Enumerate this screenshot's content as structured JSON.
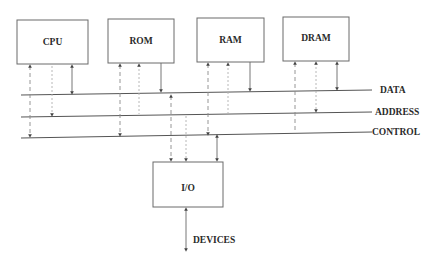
{
  "diagram": {
    "components": [
      {
        "id": "cpu",
        "label": "CPU",
        "x": 17,
        "y": 20,
        "w": 71,
        "h": 44
      },
      {
        "id": "rom",
        "label": "ROM",
        "x": 108,
        "y": 19,
        "w": 66,
        "h": 44
      },
      {
        "id": "ram",
        "label": "RAM",
        "x": 197,
        "y": 18,
        "w": 67,
        "h": 44
      },
      {
        "id": "dram",
        "label": "DRAM",
        "x": 283,
        "y": 17,
        "w": 66,
        "h": 44
      },
      {
        "id": "io",
        "label": "I/O",
        "x": 153,
        "y": 162,
        "w": 70,
        "h": 45
      }
    ],
    "buses": {
      "data": {
        "label": "DATA"
      },
      "address": {
        "label": "ADDRESS"
      },
      "control": {
        "label": "CONTROL"
      }
    },
    "external": {
      "label": "DEVICES"
    },
    "colors": {
      "line": "#555555",
      "text": "#2a2a2a",
      "background": "#ffffff"
    }
  }
}
